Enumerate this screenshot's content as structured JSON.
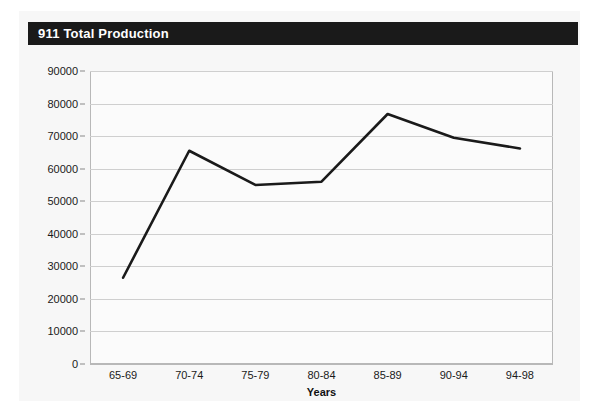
{
  "card": {
    "title": "911 Total Production",
    "title_bar_color": "#1a1a1a",
    "title_text_color": "#ffffff",
    "background_color": "#f7f7f7"
  },
  "chart_data": {
    "type": "line",
    "title": "911 Total Production",
    "categories": [
      "65-69",
      "70-74",
      "75-79",
      "80-84",
      "85-89",
      "90-94",
      "94-98"
    ],
    "values": [
      26500,
      65500,
      55000,
      56000,
      76800,
      69500,
      66200
    ],
    "series": [
      {
        "name": "911 Total Production",
        "values": [
          26500,
          65500,
          55000,
          56000,
          76800,
          69500,
          66200
        ],
        "color": "#1a1a1a",
        "line_width": 2.6,
        "markers": false
      }
    ],
    "xlabel": "Years",
    "ylabel": "",
    "ylim": [
      0,
      90000
    ],
    "ytick_step": 10000,
    "yticks": [
      0,
      10000,
      20000,
      30000,
      40000,
      50000,
      60000,
      70000,
      80000,
      90000
    ],
    "ytick_labels": [
      "0",
      "10000",
      "20000",
      "30000",
      "40000",
      "50000",
      "60000",
      "70000",
      "80000",
      "90000"
    ],
    "grid": {
      "horizontal": true,
      "vertical": false,
      "color": "#cfcfcf"
    },
    "legend": {
      "visible": false,
      "position": "none"
    },
    "plot_background": "#fbfbfb",
    "plot_border_color": "#b8b8b8"
  }
}
